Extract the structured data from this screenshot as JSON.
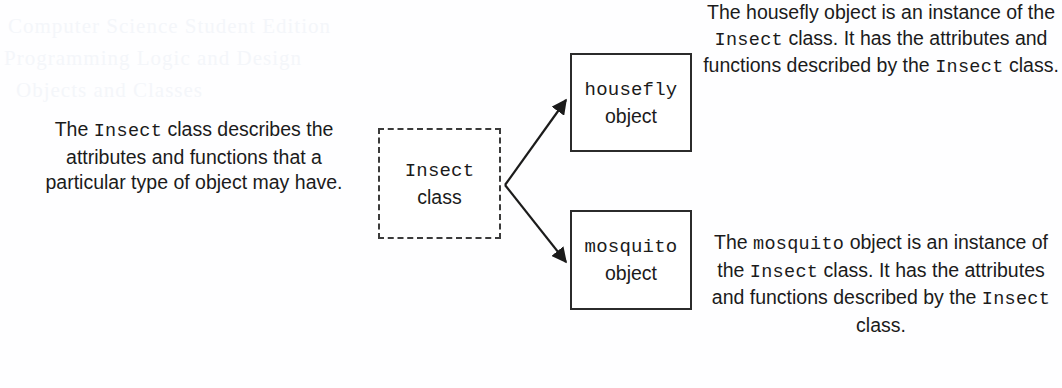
{
  "figure": {
    "background_color": "#fefeff",
    "ink_color": "#1b1b1b"
  },
  "boxes": {
    "insect_class": {
      "line1": "Insect",
      "line2": "class",
      "border_style": "dashed",
      "border_color": "#3b3b3b"
    },
    "housefly_object": {
      "line1": "housefly",
      "line2": "object",
      "border_style": "solid",
      "border_color": "#2b2b2b"
    },
    "mosquito_object": {
      "line1": "mosquito",
      "line2": "object",
      "border_style": "solid",
      "border_color": "#2b2b2b"
    }
  },
  "captions": {
    "insect_class": {
      "part1": "The ",
      "code1": "Insect",
      "part2": " class describes the attributes and functions that a particular type of object may have."
    },
    "housefly": {
      "part1": "The housefly object is an instance of the ",
      "code1": "Insect",
      "part2": " class. It has the attributes and functions described by the ",
      "code2": "Insect",
      "part3": " class."
    },
    "mosquito": {
      "part1": "The ",
      "code1": "mosquito",
      "part2": " object is an instance of the ",
      "code2": "Insect",
      "part3": " class. It has the attributes and functions described by the ",
      "code3": "Insect",
      "part4": " class."
    }
  },
  "connectors": [
    {
      "name": "class-to-housefly-arrow",
      "from": "insect_class",
      "to": "housefly_object",
      "style": "solid-arrow"
    },
    {
      "name": "class-to-mosquito-arrow",
      "from": "insect_class",
      "to": "mosquito_object",
      "style": "solid-arrow"
    }
  ],
  "bleed_through": {
    "line1": "Computer Science Student Edition",
    "line2": "Programming Logic and Design",
    "line3": "Objects and Classes"
  }
}
